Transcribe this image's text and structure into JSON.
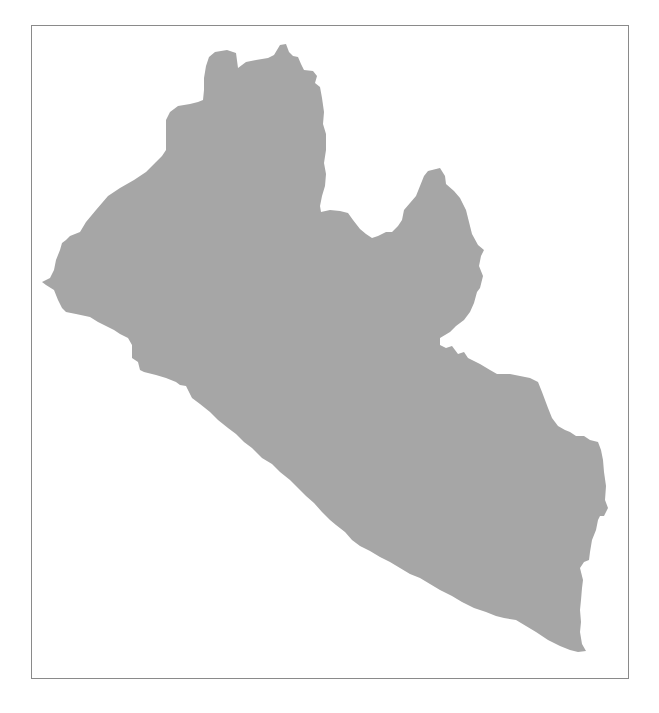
{
  "map": {
    "type": "country-silhouette",
    "region": "Liberia",
    "colors": {
      "land_fill": "#a6a6a6",
      "background": "#ffffff",
      "frame_border": "#8a8a8a"
    },
    "frame": {
      "x": 31,
      "y": 25,
      "width": 598,
      "height": 654
    }
  }
}
